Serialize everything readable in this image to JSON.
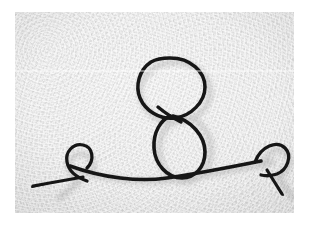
{
  "image": {
    "subject": "black wire bent into a figure-eight stick-figure shape",
    "medium": "photograph",
    "background_surface": "textured white-gray paper",
    "alt_text": "A thin black wire bent into two stacked loops resembling a figure eight, resting on a long horizontal wire line that ends in a small curl at each side.",
    "border_color": "#ffffff",
    "paper_color": "#e9e9e9",
    "wire_color": "#141414",
    "shadow_color": "#b8b8b8"
  },
  "frame": {
    "x": 15,
    "y": 12,
    "width": 279,
    "height": 201
  },
  "artifacts": {
    "scanline_label": "horizontal scan line",
    "scanline_y": 58
  },
  "shapes": [
    {
      "name": "upper-loop",
      "type": "ellipse",
      "cx": 155,
      "cy": 76,
      "rx": 35,
      "ry": 30
    },
    {
      "name": "lower-loop",
      "type": "ellipse",
      "cx": 165,
      "cy": 134,
      "rx": 26,
      "ry": 32
    },
    {
      "name": "horizontal-wire",
      "type": "curve"
    },
    {
      "name": "left-curl",
      "type": "loop",
      "cx": 68,
      "cy": 160
    },
    {
      "name": "right-curl",
      "type": "loop",
      "cx": 258,
      "cy": 155
    },
    {
      "name": "left-tail",
      "type": "line"
    },
    {
      "name": "right-tail",
      "type": "line"
    }
  ]
}
